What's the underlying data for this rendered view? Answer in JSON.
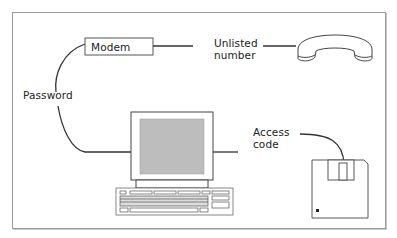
{
  "diagram": {
    "nodes": {
      "modem": {
        "label": "Modem"
      },
      "phone": {
        "icon": "telephone-handset-icon"
      },
      "computer": {
        "icon": "computer-icon"
      },
      "floppy": {
        "icon": "floppy-disk-icon"
      }
    },
    "edges": {
      "password": {
        "label": "Password"
      },
      "unlisted_line1": "Unlisted",
      "unlisted_line2": "number",
      "access_line1": "Access",
      "access_line2": "code"
    },
    "colors": {
      "line": "#333333",
      "screen": "#bdbdbd",
      "frame": "#9a9a9a"
    }
  }
}
